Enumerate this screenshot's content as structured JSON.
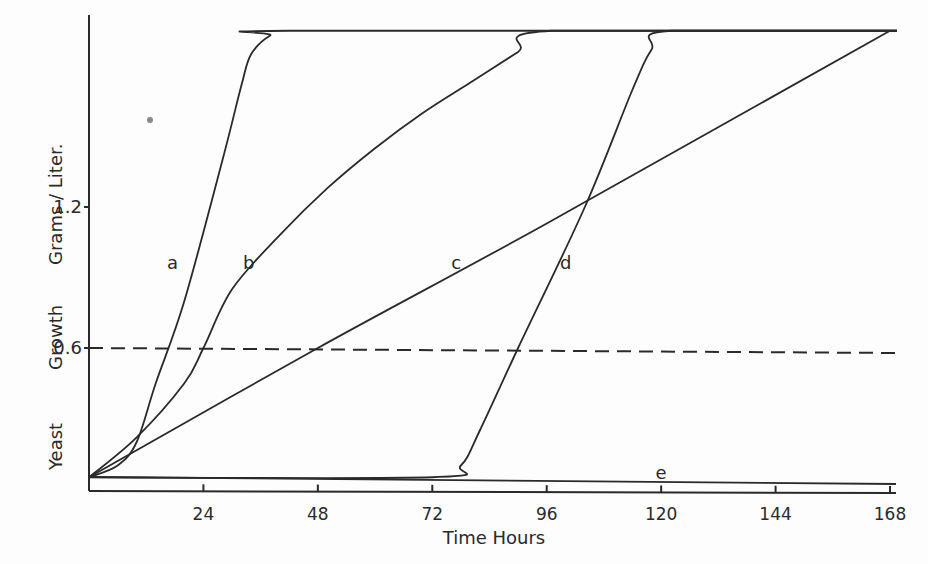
{
  "chart_data": {
    "type": "line",
    "title": "",
    "xlabel": "Time Hours",
    "ylabel": "Yeast Growth Grams / Liter.",
    "ylabel_parts": [
      "Yeast",
      "Growth",
      "Grams / Liter."
    ],
    "xlim": [
      0,
      168
    ],
    "ylim": [
      0,
      1.95
    ],
    "x_ticks": [
      24,
      48,
      72,
      96,
      120,
      144,
      168
    ],
    "x_tick_labels": [
      "24",
      "48",
      "72",
      "96",
      "120",
      "144",
      "168"
    ],
    "y_ticks": [
      0.6,
      1.2
    ],
    "y_tick_labels": [
      "0.6",
      "1.2"
    ],
    "grid": false,
    "legend": "inline curve labels",
    "reference_line": {
      "y": 0.6,
      "style": "dashed",
      "x_range": [
        0,
        168
      ]
    },
    "series": [
      {
        "name": "a",
        "x": [
          0,
          6,
          10,
          14,
          20,
          28,
          32,
          34,
          38,
          42,
          168
        ],
        "y": [
          0.05,
          0.1,
          0.2,
          0.45,
          0.8,
          1.4,
          1.72,
          1.85,
          1.93,
          1.95,
          1.95
        ]
      },
      {
        "name": "b",
        "x": [
          0,
          10,
          20,
          24,
          30,
          40,
          50,
          60,
          70,
          80,
          90,
          97,
          168
        ],
        "y": [
          0.05,
          0.22,
          0.45,
          0.6,
          0.85,
          1.08,
          1.28,
          1.45,
          1.6,
          1.73,
          1.86,
          1.95,
          1.95
        ]
      },
      {
        "name": "c",
        "x": [
          0,
          48,
          96,
          168
        ],
        "y": [
          0.05,
          0.6,
          1.13,
          1.95
        ]
      },
      {
        "name": "d",
        "x": [
          0,
          72,
          78,
          82,
          90,
          104,
          114,
          118,
          122,
          168
        ],
        "y": [
          0.05,
          0.05,
          0.1,
          0.25,
          0.6,
          1.2,
          1.7,
          1.87,
          1.95,
          1.95
        ]
      },
      {
        "name": "e",
        "x": [
          0,
          168
        ],
        "y": [
          0.05,
          0.03
        ]
      }
    ],
    "annotations": [
      {
        "text": "a",
        "x": 17.5,
        "y": 0.96
      },
      {
        "text": "b",
        "x": 33.5,
        "y": 0.96
      },
      {
        "text": "c",
        "x": 77,
        "y": 0.96
      },
      {
        "text": "d",
        "x": 100,
        "y": 0.96
      },
      {
        "text": "e",
        "x": 120,
        "y": 0.07
      }
    ]
  }
}
